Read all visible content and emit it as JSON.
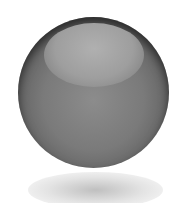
{
  "image": {
    "subject": "glossy-gray-sphere",
    "colors": {
      "background": "#ffffff",
      "sphere_mid": "#7a7a7a",
      "sphere_edge": "#3a3a3a",
      "highlight": "#b0b0b0",
      "reflection": "#c8c8c8"
    }
  }
}
